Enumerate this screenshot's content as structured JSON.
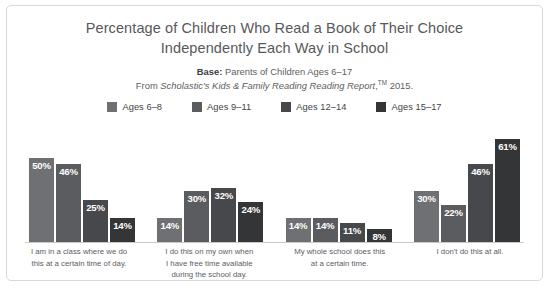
{
  "chart_data": {
    "type": "bar",
    "title": "Percentage of Children Who Read a Book of Their Choice Independently Each Way in School",
    "title_lines": [
      "Percentage of Children Who Read a Book of Their Choice",
      "Independently Each Way in School"
    ],
    "subtitle": {
      "base_label": "Base:",
      "base_text": " Parents of Children Ages 6–17",
      "source_prefix": "From ",
      "source_italic": "Scholastic's Kids & Family Reading Reading Report",
      "source_tm": "TM",
      "source_suffix": " 2015."
    },
    "xlabel": "",
    "ylabel": "",
    "ylim": [
      0,
      70
    ],
    "grid": false,
    "legend_position": "top",
    "value_suffix": "%",
    "categories": [
      "I am in a class where we do this at a certain time of day.",
      "I do this on my own when I have free time available during the school day.",
      "My whole school does this at a certain time.",
      "I don't do this at all."
    ],
    "category_lines": [
      [
        "I am in a class where we do",
        "this at a certain time of day."
      ],
      [
        "I do this on my own when",
        "I have free time available",
        "during the school day."
      ],
      [
        "My whole school does this",
        "at a certain time."
      ],
      [
        "I don't do this at all."
      ]
    ],
    "series": [
      {
        "name": "Ages 6–8",
        "color": "#6f7073",
        "values": [
          50,
          14,
          14,
          30
        ]
      },
      {
        "name": "Ages 9–11",
        "color": "#5b5c5f",
        "values": [
          46,
          30,
          14,
          22
        ]
      },
      {
        "name": "Ages 12–14",
        "color": "#47484b",
        "values": [
          25,
          32,
          11,
          46
        ]
      },
      {
        "name": "Ages 15–17",
        "color": "#343537",
        "values": [
          14,
          24,
          8,
          61
        ]
      }
    ]
  }
}
